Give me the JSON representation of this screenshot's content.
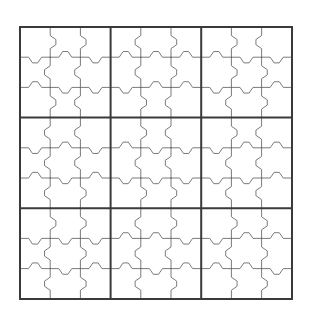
{
  "figure": {
    "background_color": "#ffffff",
    "thin_line_color": "#6b6b6b",
    "thick_line_color": "#3a3a3a",
    "outer_frame_color": "#3a3a3a",
    "thin_line_width": 0.9,
    "thick_line_width": 2.0
  },
  "grid": {
    "rows": 9,
    "columns": 9,
    "block_rows": 3,
    "block_columns": 3,
    "cell_size_px": 30.2,
    "origin_x_px": 20,
    "origin_y_px": 27,
    "width_px": 272,
    "height_px": 272,
    "tab_style": "jigsaw-knob",
    "tab_radius_px": 4.2,
    "cell_values": [
      [
        "",
        "",
        "",
        "",
        "",
        "",
        "",
        "",
        ""
      ],
      [
        "",
        "",
        "",
        "",
        "",
        "",
        "",
        "",
        ""
      ],
      [
        "",
        "",
        "",
        "",
        "",
        "",
        "",
        "",
        ""
      ],
      [
        "",
        "",
        "",
        "",
        "",
        "",
        "",
        "",
        ""
      ],
      [
        "",
        "",
        "",
        "",
        "",
        "",
        "",
        "",
        ""
      ],
      [
        "",
        "",
        "",
        "",
        "",
        "",
        "",
        "",
        ""
      ],
      [
        "",
        "",
        "",
        "",
        "",
        "",
        "",
        "",
        ""
      ],
      [
        "",
        "",
        "",
        "",
        "",
        "",
        "",
        "",
        ""
      ],
      [
        "",
        "",
        "",
        "",
        "",
        "",
        "",
        "",
        ""
      ]
    ]
  },
  "chart_data": {
    "type": "diagram",
    "rows": 9,
    "columns": 9,
    "blocks": 9,
    "filled_cells": 0,
    "empty_cells": 81
  }
}
